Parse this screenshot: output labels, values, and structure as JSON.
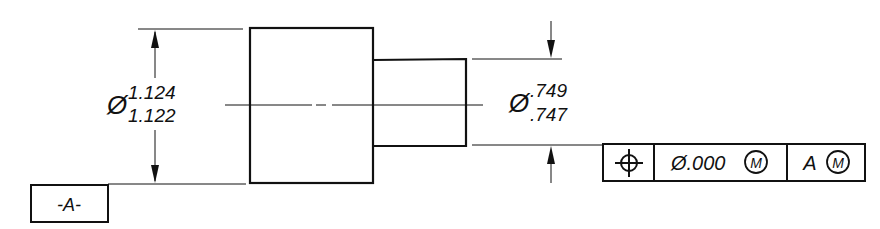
{
  "drawing": {
    "type": "stepped shaft with GD&T",
    "colors": {
      "line": "#111111",
      "background": "#ffffff"
    },
    "large_diameter": {
      "symbol": "Ø",
      "upper": "1.124",
      "lower": "1.122"
    },
    "small_diameter": {
      "symbol": "Ø",
      "upper": ".749",
      "lower": ".747"
    },
    "datum_label": "-A-",
    "feature_control_frame": {
      "characteristic_symbol": "position-icon",
      "tolerance": "Ø.000",
      "tolerance_modifier": "M",
      "datum": "A",
      "datum_modifier": "M"
    }
  }
}
